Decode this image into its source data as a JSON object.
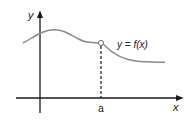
{
  "diagram": {
    "title": "",
    "axes": {
      "x_label": "x",
      "y_label": "y"
    },
    "curve": {
      "label": "y = f(x)",
      "color": "#8a8a8a"
    },
    "point": {
      "label": "a",
      "marker": "open-circle",
      "note": "removable discontinuity (hole) at x = a"
    },
    "colors": {
      "axis": "#1a1a1a",
      "curve": "#8a8a8a",
      "dashed_guide": "#1a1a1a",
      "background": "#ffffff"
    }
  }
}
